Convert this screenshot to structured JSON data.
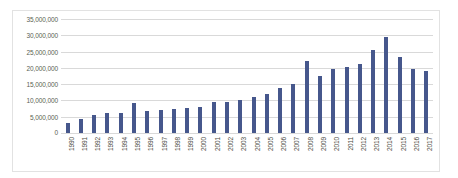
{
  "chart_data": {
    "type": "bar",
    "title": "",
    "subtitle": "",
    "xlabel": "",
    "ylabel": "",
    "ylim": [
      0,
      35000000
    ],
    "ytick_step": 5000000,
    "ytick_labels": [
      "35,000,000",
      "30,000,000",
      "25,000,000",
      "20,000,000",
      "15,000,000",
      "10,000,000",
      "5,000,000",
      "0"
    ],
    "ytick_values": [
      35000000,
      30000000,
      25000000,
      20000000,
      15000000,
      10000000,
      5000000,
      0
    ],
    "grid": true,
    "legend": false,
    "legend_position": "none",
    "bar_color": "#46578c",
    "gridline_color": "#d9d9d9",
    "border_color": "#e2e2e2",
    "categories": [
      "1990",
      "1991",
      "1992",
      "1993",
      "1994",
      "1995",
      "1996",
      "1997",
      "1998",
      "1999",
      "2000",
      "2001",
      "2002",
      "2003",
      "2004",
      "2005",
      "2006",
      "2007",
      "2008",
      "2009",
      "2010",
      "2011",
      "2012",
      "2013",
      "2014",
      "2015",
      "2016",
      "2017"
    ],
    "values": [
      3200000,
      4300000,
      5400000,
      6000000,
      6200000,
      9300000,
      6800000,
      7200000,
      7400000,
      7600000,
      8100000,
      9400000,
      9600000,
      10100000,
      11200000,
      11900000,
      13800000,
      15100000,
      22000000,
      17400000,
      19600000,
      20300000,
      21300000,
      25500000,
      29500000,
      23300000,
      19600000,
      19000000
    ]
  }
}
